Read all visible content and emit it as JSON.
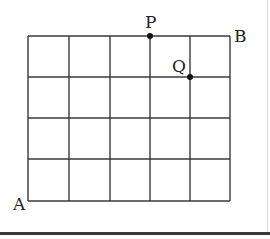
{
  "diagram": {
    "type": "grid-path",
    "columns": 5,
    "rows": 4,
    "grid": {
      "x_lines": [
        28,
        69,
        110,
        150,
        190,
        230
      ],
      "y_lines": [
        36,
        77,
        118,
        159,
        201
      ],
      "line_color": "#3a3a3a"
    },
    "points": [
      {
        "name": "A",
        "label": "A",
        "grid_col": 0,
        "grid_row": 0,
        "marked": false
      },
      {
        "name": "B",
        "label": "B",
        "grid_col": 5,
        "grid_row": 4,
        "marked": false
      },
      {
        "name": "P",
        "label": "P",
        "grid_col": 3,
        "grid_row": 4,
        "marked": true
      },
      {
        "name": "Q",
        "label": "Q",
        "grid_col": 4,
        "grid_row": 3,
        "marked": true
      }
    ],
    "labels": {
      "A": "A",
      "B": "B",
      "P": "P",
      "Q": "Q"
    }
  }
}
